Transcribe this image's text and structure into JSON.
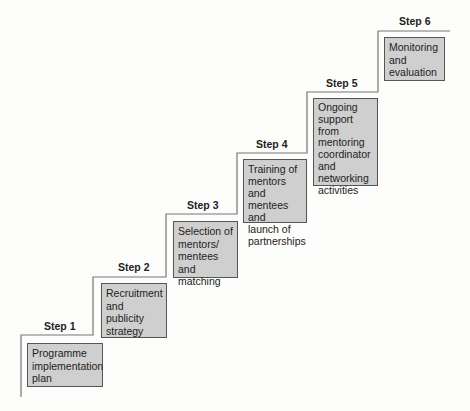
{
  "diagram": {
    "type": "staircase",
    "colors": {
      "background": "#fdfdfb",
      "box_fill": "#cfcfcf",
      "box_border": "#555555",
      "line": "#777777",
      "text": "#222222"
    },
    "steps": [
      {
        "label": "Step 1",
        "lines": [
          "Programme",
          "implementation",
          "plan"
        ]
      },
      {
        "label": "Step 2",
        "lines": [
          "Recruitment",
          "and",
          "publicity",
          "strategy"
        ]
      },
      {
        "label": "Step 3",
        "lines": [
          "Selection of",
          "mentors/",
          "mentees and",
          "matching"
        ]
      },
      {
        "label": "Step 4",
        "lines": [
          "Training of",
          "mentors and",
          "mentees and",
          "launch of",
          "partnerships"
        ]
      },
      {
        "label": "Step 5",
        "lines": [
          "Ongoing",
          "support from",
          "mentoring",
          "coordinator",
          "and",
          "networking",
          "activities"
        ]
      },
      {
        "label": "Step 6",
        "lines": [
          "Monitoring",
          "and",
          "evaluation"
        ]
      }
    ]
  }
}
